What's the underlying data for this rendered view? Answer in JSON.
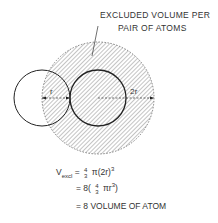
{
  "callout": {
    "line1": "EXCLUDED VOLUME PER",
    "line2": "PAIR OF ATOMS"
  },
  "labels": {
    "r": "r",
    "two_r": "2r"
  },
  "equations": {
    "v_symbol": "V",
    "v_sub": "excl",
    "eq1_equals": "=",
    "frac_num": "4",
    "frac_den": "3",
    "eq1_rest": "π(2r)",
    "eq1_exp": "3",
    "eq2_prefix": "= 8(",
    "eq2_rest": "πr",
    "eq2_exp": "3",
    "eq2_close": ")",
    "eq3": "= 8 VOLUME OF ATOM"
  },
  "colors": {
    "line": "#222222",
    "hatch": "#888888"
  }
}
